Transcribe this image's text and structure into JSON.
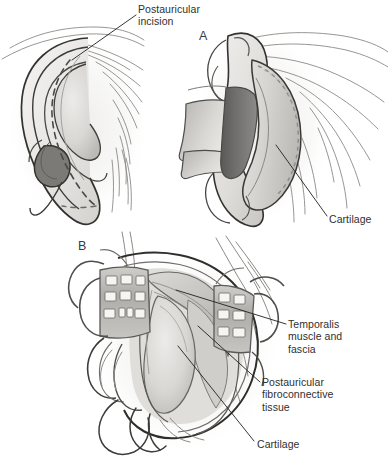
{
  "figure": {
    "type": "medical-illustration",
    "background_color": "#ffffff",
    "ink_color": "#2f2f2f",
    "panels": [
      {
        "letter": "A",
        "name": "panel-a",
        "description": "Auricle reflected anteriorly exposing posterior cartilage surface"
      },
      {
        "letter": "B",
        "name": "panel-b",
        "description": "Surgical field held open with two self-retaining retractors"
      }
    ],
    "labels": [
      {
        "id": "postauricular-incision",
        "text": "Postauricular\nincision",
        "anchor_x": 138,
        "anchor_y": 3,
        "leader_from": [
          136,
          16
        ],
        "leader_to": [
          72,
          60
        ]
      },
      {
        "id": "cartilage-a",
        "text": "Cartilage",
        "anchor_x": 329,
        "anchor_y": 213,
        "leader_from": [
          327,
          216
        ],
        "leader_to": [
          276,
          145
        ]
      },
      {
        "id": "temporalis-muscle-and-fascia",
        "text": "Temporalis\nmuscle and\nfascia",
        "anchor_x": 288,
        "anchor_y": 318,
        "leader_from": [
          286,
          324
        ],
        "leader_to": [
          176,
          290
        ]
      },
      {
        "id": "postauricular-fibroconnective-tissue",
        "text": "Postauricular\nfibroconnective\ntissue",
        "anchor_x": 262,
        "anchor_y": 376,
        "leader_from": [
          260,
          382
        ],
        "leader_to": [
          198,
          325
        ]
      },
      {
        "id": "cartilage-b",
        "text": "Cartilage",
        "anchor_x": 257,
        "anchor_y": 438,
        "leader_from": [
          254,
          441
        ],
        "leader_to": [
          178,
          345
        ]
      }
    ],
    "colors": {
      "outline_dark": "#33322f",
      "outline_mid": "#6f6f6c",
      "outline_light": "#9a9a97",
      "skin_light": "#f0efee",
      "skin_mid": "#e0dedc",
      "skin_shadow": "#cdcbc8",
      "cartilage_fill": "#d8d6d3",
      "deep_shadow": "#767572",
      "deep_shadow_dark": "#5d5c59",
      "retractor_metal": "#b9b8b4",
      "retractor_tooth": "#f6f5f3",
      "muscle_fill": "#c9c7c4",
      "leader_line": "#1f1f1f"
    }
  }
}
